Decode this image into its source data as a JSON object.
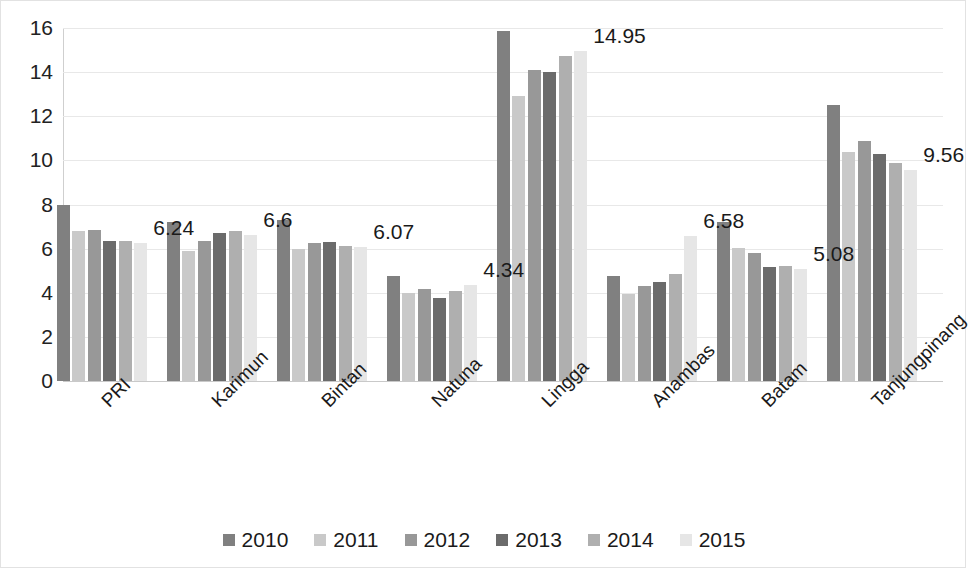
{
  "chart_data": {
    "type": "bar",
    "title": "",
    "subtitle": "",
    "xlabel": "",
    "ylabel": "",
    "ylim": [
      0,
      16
    ],
    "ytick_step": 2,
    "yticks": [
      "0",
      "2",
      "4",
      "6",
      "8",
      "10",
      "12",
      "14",
      "16"
    ],
    "grid": true,
    "legend_position": "bottom",
    "categories": [
      "PRI",
      "Karimun",
      "Bintan",
      "Natuna",
      "Lingga",
      "Anambas",
      "Batam",
      "Tanjungpinang"
    ],
    "series": [
      {
        "name": "2010",
        "color": "#808080",
        "values": [
          8.0,
          7.2,
          7.3,
          4.75,
          15.85,
          4.75,
          7.2,
          12.5
        ]
      },
      {
        "name": "2011",
        "color": "#c9c9c9",
        "values": [
          6.8,
          5.9,
          6.0,
          4.0,
          12.9,
          3.95,
          6.05,
          10.4
        ]
      },
      {
        "name": "2012",
        "color": "#989898",
        "values": [
          6.85,
          6.35,
          6.25,
          4.15,
          14.1,
          4.3,
          5.8,
          10.9
        ]
      },
      {
        "name": "2013",
        "color": "#6b6b6b",
        "values": [
          6.35,
          6.7,
          6.3,
          3.75,
          14.0,
          4.5,
          5.15,
          10.3
        ]
      },
      {
        "name": "2014",
        "color": "#afafaf",
        "values": [
          6.35,
          6.8,
          6.1,
          4.1,
          14.75,
          4.85,
          5.2,
          9.9
        ]
      },
      {
        "name": "2015",
        "color": "#e6e6e6",
        "values": [
          6.24,
          6.6,
          6.07,
          4.34,
          14.95,
          6.58,
          5.08,
          9.56
        ]
      }
    ],
    "data_labels": [
      {
        "category": "PRI",
        "series": "2015",
        "text": "6.24"
      },
      {
        "category": "Karimun",
        "series": "2015",
        "text": "6.6"
      },
      {
        "category": "Bintan",
        "series": "2015",
        "text": "6.07"
      },
      {
        "category": "Natuna",
        "series": "2015",
        "text": "4.34"
      },
      {
        "category": "Lingga",
        "series": "2015",
        "text": "14.95"
      },
      {
        "category": "Anambas",
        "series": "2015",
        "text": "6.58"
      },
      {
        "category": "Batam",
        "series": "2015",
        "text": "5.08"
      },
      {
        "category": "Tanjungpinang",
        "series": "2015",
        "text": "9.56"
      }
    ]
  },
  "legend": {
    "items": [
      {
        "label": "2010",
        "color": "#808080"
      },
      {
        "label": "2011",
        "color": "#c9c9c9"
      },
      {
        "label": "2012",
        "color": "#989898"
      },
      {
        "label": "2013",
        "color": "#6b6b6b"
      },
      {
        "label": "2014",
        "color": "#afafaf"
      },
      {
        "label": "2015",
        "color": "#e6e6e6"
      }
    ]
  }
}
